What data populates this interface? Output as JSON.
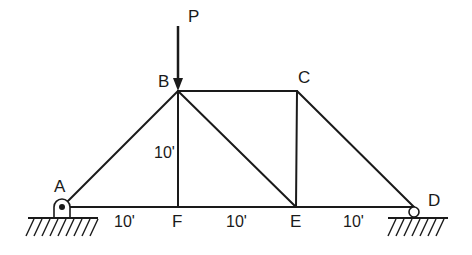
{
  "diagram": {
    "type": "truss",
    "load": {
      "label": "P",
      "at_joint": "B",
      "direction": "down"
    },
    "joints": {
      "A": {
        "label": "A",
        "support": "pin"
      },
      "B": {
        "label": "B"
      },
      "C": {
        "label": "C"
      },
      "D": {
        "label": "D",
        "support": "roller"
      },
      "E": {
        "label": "E"
      },
      "F": {
        "label": "F"
      }
    },
    "members": [
      "AB",
      "BC",
      "CD",
      "AF",
      "FE",
      "ED",
      "BF",
      "BE",
      "CE"
    ],
    "dimensions": {
      "height_BF": "10'",
      "span_AF": "10'",
      "span_FE": "10'",
      "span_ED": "10'"
    },
    "colors": {
      "ink": "#1a1a1a",
      "background": "#ffffff"
    }
  }
}
